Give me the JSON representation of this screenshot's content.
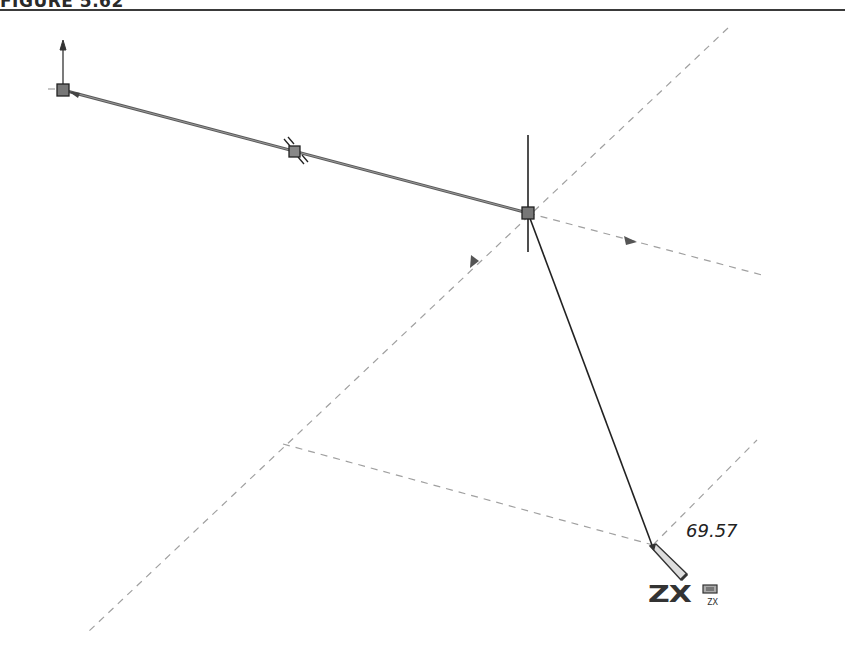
{
  "figure": {
    "label": "FIGURE 5.62"
  },
  "sketch": {
    "dimension_value": "69.57",
    "cursor_plane_label": "ZX",
    "cursor_plane_sublabel": "ZX",
    "colors": {
      "sketch_line": "#555555",
      "construction_line": "#9a9a9a",
      "active_line": "#222222",
      "point_fill": "#7a7a7a"
    },
    "icons": [
      "origin-arrow-icon",
      "parallel-constraint-icon",
      "pencil-cursor-icon",
      "plane-indicator-icon",
      "direction-arrow-icon"
    ]
  }
}
